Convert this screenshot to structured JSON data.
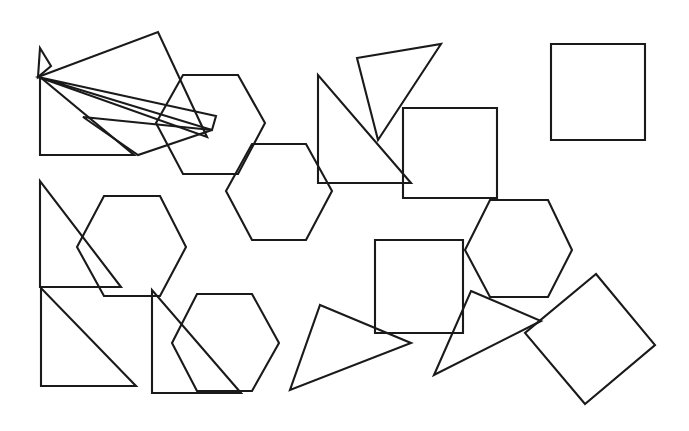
{
  "canvas": {
    "width": 689,
    "height": 431,
    "background_color": "#ffffff",
    "stroke_color": "#1a1a1a",
    "stroke_width": 2.1,
    "fill": "none",
    "description": "Line drawing of overlapping outlined geometric shapes: triangles, hexagons and squares"
  },
  "shapes": [
    {
      "id": "thin-triangle-top-left-small",
      "type": "triangle",
      "points": "40,48 51,66 38,77"
    },
    {
      "id": "large-thin-triangle-upper-left",
      "type": "triangle",
      "points": "38,77 158,32 207,137"
    },
    {
      "id": "thin-sliver-triangle-left",
      "type": "triangle",
      "points": "38,77 216,116 212,130"
    },
    {
      "id": "right-triangle-upper-left",
      "type": "triangle",
      "points": "40,77 40,155 134,155"
    },
    {
      "id": "slanted-triangle-upper-left",
      "type": "triangle",
      "points": "83,117 138,155 212,130"
    },
    {
      "id": "hexagon-upper-left",
      "type": "hexagon",
      "points": "183,75 238,75 265,123 238,174 183,174 156,123"
    },
    {
      "id": "hexagon-upper-middle",
      "type": "hexagon",
      "points": "252,144 306,144 332,191 306,240 252,240 226,191"
    },
    {
      "id": "triangle-upper-middle-right",
      "type": "triangle",
      "points": "357,58 441,44 378,140"
    },
    {
      "id": "right-triangle-upper-middle",
      "type": "triangle",
      "points": "318,75 318,183 411,183"
    },
    {
      "id": "square-upper-middle",
      "type": "square",
      "points": "403,108 497,108 497,198 403,198"
    },
    {
      "id": "square-top-right",
      "type": "square",
      "points": "551,44 645,44 645,140 551,140"
    },
    {
      "id": "right-triangle-middle-left",
      "type": "triangle",
      "points": "40,181 40,287 121,287"
    },
    {
      "id": "hexagon-middle-left",
      "type": "hexagon",
      "points": "104,196 160,196 186,247 160,296 104,296 77,247"
    },
    {
      "id": "right-triangle-lower-left",
      "type": "triangle",
      "points": "41,288 41,386 136,386"
    },
    {
      "id": "right-triangle-lower-middle-left",
      "type": "triangle",
      "points": "152,290 152,393 241,393"
    },
    {
      "id": "hexagon-lower-left",
      "type": "hexagon",
      "points": "197,294 252,294 279,343 252,391 197,391 172,343"
    },
    {
      "id": "triangle-lower-middle",
      "type": "triangle",
      "points": "320,305 411,343 290,390"
    },
    {
      "id": "square-lower-middle",
      "type": "square",
      "points": "375,240 463,240 463,333 375,333"
    },
    {
      "id": "hexagon-middle-right",
      "type": "hexagon",
      "points": "490,200 548,200 572,250 548,297 490,297 465,250"
    },
    {
      "id": "triangle-lower-right",
      "type": "triangle",
      "points": "471,291 541,321 434,375"
    },
    {
      "id": "rotated-square-lower-right",
      "type": "square",
      "points": "596,274 655,345 585,404 525,333"
    }
  ]
}
